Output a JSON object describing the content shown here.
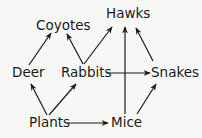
{
  "diagram": {
    "type": "food-web",
    "nodes": {
      "hawks": {
        "label": "Hawks"
      },
      "coyotes": {
        "label": "Coyotes"
      },
      "deer": {
        "label": "Deer"
      },
      "rabbits": {
        "label": "Rabbits"
      },
      "snakes": {
        "label": "Snakes"
      },
      "plants": {
        "label": "Plants"
      },
      "mice": {
        "label": "Mice"
      }
    },
    "edges": [
      {
        "from": "Plants",
        "to": "Deer"
      },
      {
        "from": "Plants",
        "to": "Rabbits"
      },
      {
        "from": "Plants",
        "to": "Mice"
      },
      {
        "from": "Deer",
        "to": "Coyotes"
      },
      {
        "from": "Rabbits",
        "to": "Coyotes"
      },
      {
        "from": "Rabbits",
        "to": "Hawks"
      },
      {
        "from": "Rabbits",
        "to": "Snakes"
      },
      {
        "from": "Mice",
        "to": "Hawks"
      },
      {
        "from": "Mice",
        "to": "Snakes"
      },
      {
        "from": "Snakes",
        "to": "Hawks"
      }
    ],
    "colors": {
      "line": "#1a1a1a",
      "background": "#f7f7f5"
    }
  }
}
